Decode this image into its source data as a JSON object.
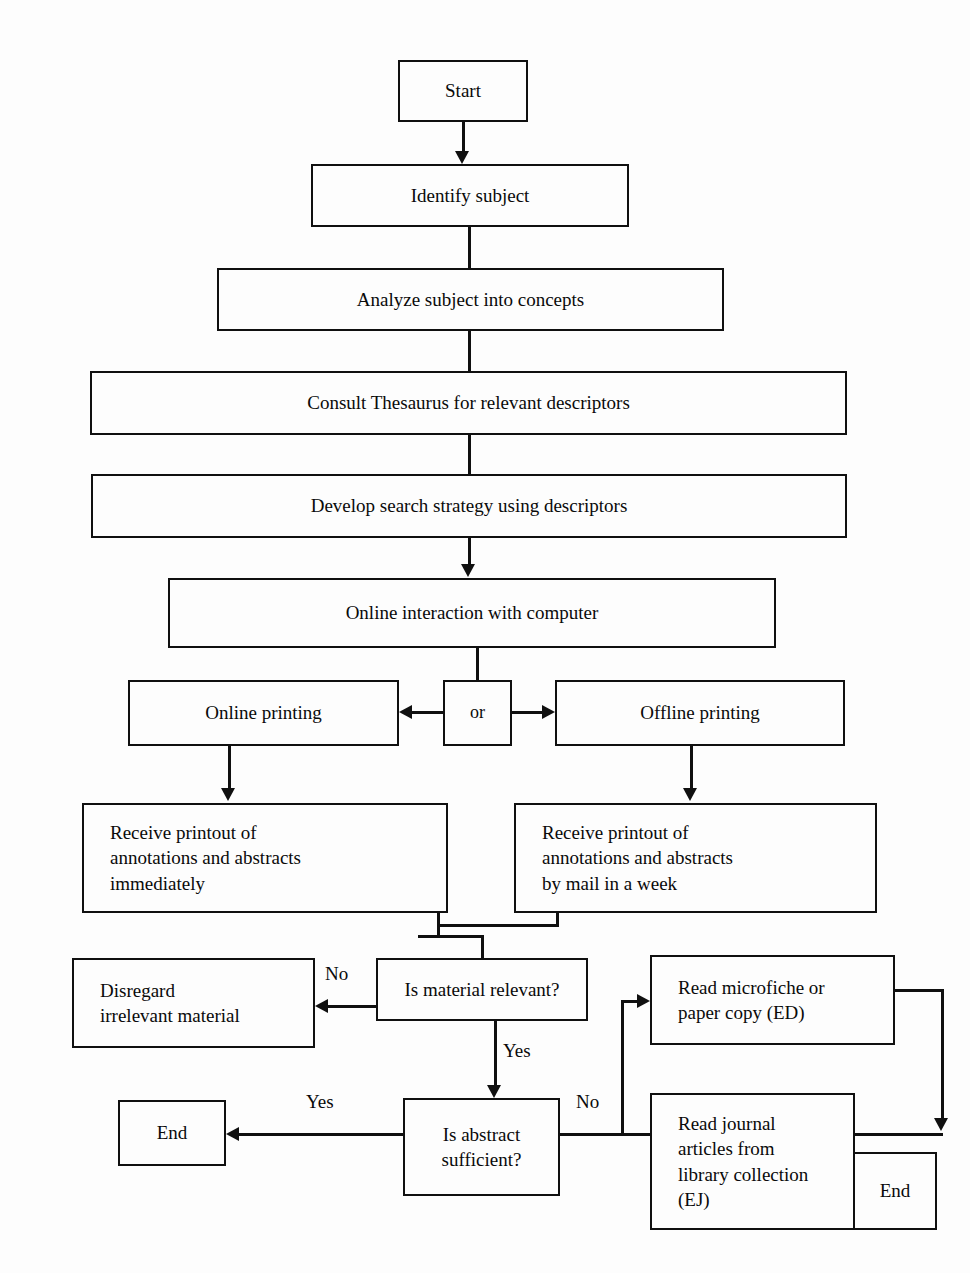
{
  "diagram": {
    "line_color": "#101010",
    "background": "#fdfdfd",
    "nodes": [
      {
        "id": "start",
        "label": "Start"
      },
      {
        "id": "identify",
        "label": "Identify subject"
      },
      {
        "id": "analyze",
        "label": "Analyze subject into concepts"
      },
      {
        "id": "thesaurus",
        "label": "Consult Thesaurus for relevant descriptors"
      },
      {
        "id": "strategy",
        "label": "Develop search strategy using descriptors"
      },
      {
        "id": "online_inter",
        "label": "Online interaction with computer"
      },
      {
        "id": "online_print",
        "label": "Online printing"
      },
      {
        "id": "or",
        "label": "or"
      },
      {
        "id": "offline_print",
        "label": "Offline printing"
      },
      {
        "id": "printout_now",
        "label": "Receive printout of\nannotations and abstracts\nimmediately"
      },
      {
        "id": "printout_mail",
        "label": "Receive printout of\nannotations and abstracts\nby mail in a week"
      },
      {
        "id": "disregard",
        "label": "Disregard\nirrelevant material"
      },
      {
        "id": "is_relevant",
        "label": "Is material relevant?"
      },
      {
        "id": "read_microfiche",
        "label": "Read microfiche or\npaper copy (ED)"
      },
      {
        "id": "end_left",
        "label": "End"
      },
      {
        "id": "is_abstract",
        "label": "Is abstract\nsufficient?"
      },
      {
        "id": "read_journal",
        "label": "Read journal\narticles  from\nlibrary collection\n(EJ)"
      },
      {
        "id": "end_right",
        "label": "End"
      }
    ],
    "edge_labels": {
      "relevant_no": "No",
      "relevant_yes": "Yes",
      "abstract_yes": "Yes",
      "abstract_no": "No"
    }
  }
}
